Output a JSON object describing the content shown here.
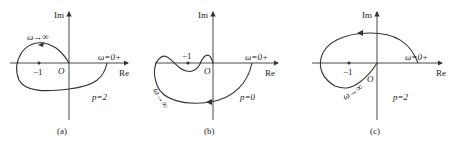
{
  "figure": {
    "type": "nyquist-plots",
    "panels": [
      {
        "id": "a",
        "caption": "(a)",
        "axis_x": "Re",
        "axis_y": "Im",
        "origin": "O",
        "critical_point": "−1",
        "start_label": "ω=0+",
        "end_label": "ω→∞",
        "pole_label": "p=2"
      },
      {
        "id": "b",
        "caption": "(b)",
        "axis_x": "Re",
        "axis_y": "Im",
        "origin": "O",
        "critical_point": "−1",
        "start_label": "ω=0+",
        "end_label": "ω→∞",
        "pole_label": "p=0"
      },
      {
        "id": "c",
        "caption": "(c)",
        "axis_x": "Re",
        "axis_y": "Im",
        "origin": "O",
        "critical_point": "−1",
        "start_label": "ω=0+",
        "end_label": "ω→∞",
        "pole_label": "p=2"
      }
    ]
  },
  "colors": {
    "line": "#333333",
    "background": "#ffffff"
  }
}
